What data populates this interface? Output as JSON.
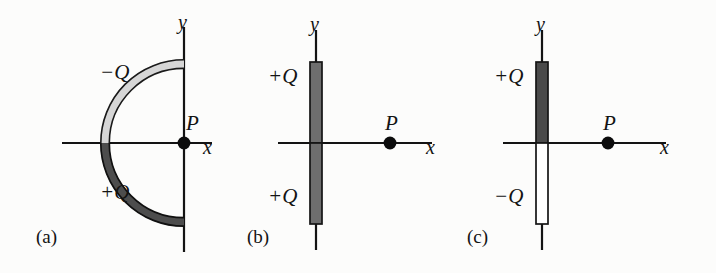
{
  "figure": {
    "background_color": "#fcfcfb",
    "ink_color": "#131313",
    "width": 716,
    "height": 273
  },
  "panels": [
    {
      "id": "a",
      "caption": "(a)",
      "shape": "semicircular-arc",
      "axis_labels": {
        "x": "x",
        "y": "y"
      },
      "point_label": "P",
      "point_position": "origin",
      "charges": [
        {
          "label": "−Q",
          "sign": "negative",
          "half": "upper",
          "fill_color": "#d4d4d4"
        },
        {
          "label": "+Q",
          "sign": "positive",
          "half": "lower",
          "fill_color": "#4a4a4a"
        }
      ]
    },
    {
      "id": "b",
      "caption": "(b)",
      "shape": "straight-rod",
      "axis_labels": {
        "x": "x",
        "y": "y"
      },
      "point_label": "P",
      "point_position": "positive-x-axis",
      "charges": [
        {
          "label": "+Q",
          "sign": "positive",
          "half": "upper",
          "fill_color": "#6e6e6e"
        },
        {
          "label": "+Q",
          "sign": "positive",
          "half": "lower",
          "fill_color": "#6e6e6e"
        }
      ]
    },
    {
      "id": "c",
      "caption": "(c)",
      "shape": "straight-rod",
      "axis_labels": {
        "x": "x",
        "y": "y"
      },
      "point_label": "P",
      "point_position": "positive-x-axis",
      "charges": [
        {
          "label": "+Q",
          "sign": "positive",
          "half": "upper",
          "fill_color": "#4a4a4a"
        },
        {
          "label": "−Q",
          "sign": "negative",
          "half": "lower",
          "fill_color": "#ffffff"
        }
      ]
    }
  ]
}
